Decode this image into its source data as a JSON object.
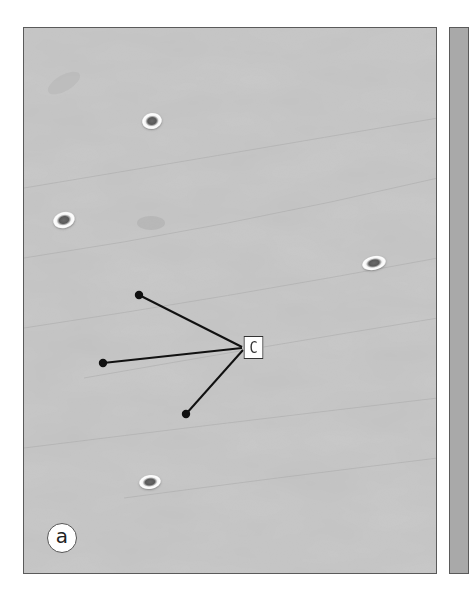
{
  "figure": {
    "panel_label": "a",
    "annotation_label": "C",
    "colors": {
      "background": "#c9c9c9",
      "border": "#5a5a5a",
      "annotation_line": "#111111",
      "label_bg": "#ffffff"
    },
    "cells": [
      {
        "cx": 152,
        "cy": 121,
        "w": 20,
        "h": 16,
        "rotate": -10
      },
      {
        "cx": 64,
        "cy": 220,
        "w": 22,
        "h": 16,
        "rotate": -15
      },
      {
        "cx": 374,
        "cy": 263,
        "w": 24,
        "h": 14,
        "rotate": -12
      },
      {
        "cx": 150,
        "cy": 482,
        "w": 22,
        "h": 14,
        "rotate": -8
      }
    ],
    "annotation_pointers": [
      {
        "from": [
          139,
          295
        ],
        "to": [
          242,
          348
        ]
      },
      {
        "from": [
          103,
          363
        ],
        "to": [
          242,
          348
        ]
      },
      {
        "from": [
          186,
          414
        ],
        "to": [
          242,
          348
        ]
      }
    ]
  }
}
